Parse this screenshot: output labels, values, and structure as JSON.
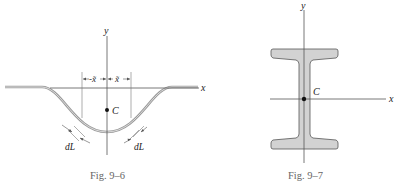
{
  "figures": [
    {
      "id": "fig-9-6",
      "caption": "Fig. 9–6",
      "labels": {
        "y_axis": "y",
        "x_axis": "x",
        "centroid": "C",
        "neg_xtilde": "-x̃",
        "pos_xtilde": "x̃",
        "dL_left": "dL",
        "dL_right": "dL"
      }
    },
    {
      "id": "fig-9-7",
      "caption": "Fig. 9–7",
      "labels": {
        "y_axis": "y",
        "x_axis": "x",
        "centroid": "C"
      }
    }
  ],
  "colors": {
    "axis": "#555555",
    "curve": "#a8a8a8",
    "beam_fill": "#d2d2d2",
    "beam_stroke": "#555555",
    "caption": "#666666"
  }
}
